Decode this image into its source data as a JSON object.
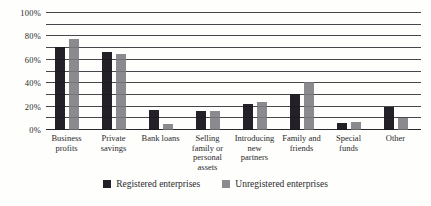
{
  "chart_data": {
    "type": "bar",
    "categories": [
      "Business profits",
      "Private savings",
      "Bank loans",
      "Selling family or personal assets",
      "Introducing new partners",
      "Family and friends",
      "Special funds",
      "Other"
    ],
    "series": [
      {
        "name": "Registered enterprises",
        "color": "#232127",
        "values": [
          71,
          67,
          17,
          16,
          22,
          31,
          6,
          20
        ]
      },
      {
        "name": "Unregistered enterprises",
        "color": "#8b8a8e",
        "values": [
          78,
          65,
          5,
          16,
          24,
          41,
          7,
          10
        ]
      }
    ],
    "ylim": [
      0,
      100
    ],
    "ytick_labels": [
      "0%",
      "20%",
      "40%",
      "60%",
      "80%",
      "100%"
    ],
    "ytick_step": 20,
    "gridline_step": 10,
    "grid": true,
    "legend_position": "bottom",
    "colors": {
      "background": "#fefefd",
      "gridline": "#55545a",
      "text": "#2a2a2c"
    }
  }
}
